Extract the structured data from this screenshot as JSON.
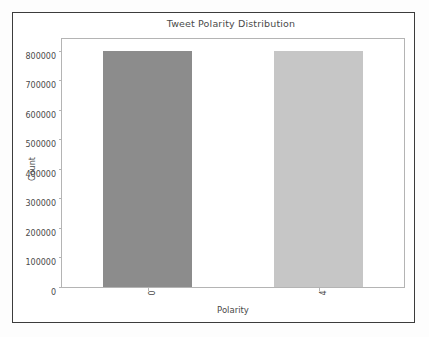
{
  "figure": {
    "background_color": "#fdfdfd",
    "frame_color": "#3c3c3c",
    "plot_background_color": "#ffffff",
    "spine_color": "#b4b4b4",
    "text_color": "#4a4a4a"
  },
  "chart_data": {
    "type": "bar",
    "title": "Tweet Polarity Distribution",
    "xlabel": "Polarity",
    "ylabel": "Count",
    "categories": [
      "0",
      "4"
    ],
    "values": [
      800000,
      800000
    ],
    "bar_colors": [
      "#8c8c8c",
      "#c6c6c6"
    ],
    "ylim": [
      0,
      840000
    ],
    "yticks": [
      0,
      100000,
      200000,
      300000,
      400000,
      500000,
      600000,
      700000,
      800000
    ],
    "ytick_labels": [
      "0",
      "100000",
      "200000",
      "300000",
      "400000",
      "500000",
      "600000",
      "700000",
      "800000"
    ],
    "xtick_labels": [
      "0",
      "4"
    ],
    "xtick_rotation": 90,
    "grid": false,
    "legend": false,
    "legend_position": "none"
  }
}
